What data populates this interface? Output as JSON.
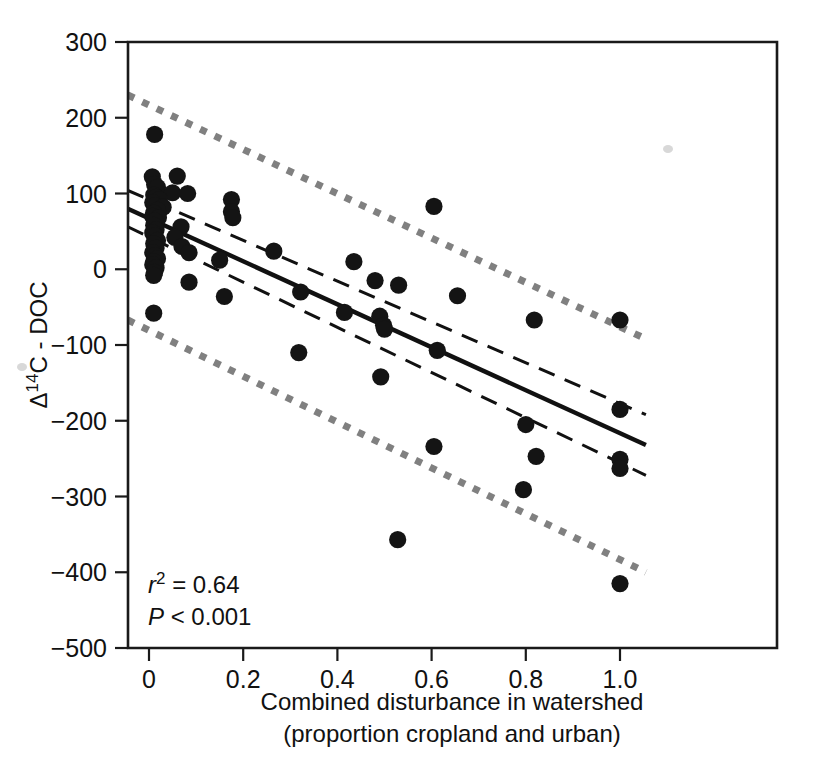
{
  "chart_data": {
    "type": "scatter",
    "title": "",
    "xlabel": "Combined disturbance in watershed",
    "xlabel_line2": "(proportion cropland and urban)",
    "ylabel": "Δ14C - DOC",
    "ylabel_delta": "Δ",
    "ylabel_sup": "14",
    "ylabel_rest": "C - DOC",
    "xlim": [
      -0.045,
      1.06
    ],
    "ylim": [
      -500,
      300
    ],
    "grid": false,
    "legend": false,
    "xticks": [
      0,
      0.2,
      0.4,
      0.6,
      0.8,
      1.0
    ],
    "xticklabels": [
      "0",
      "0.2",
      "0.4",
      "0.6",
      "0.8",
      "1.0"
    ],
    "yticks": [
      300,
      200,
      100,
      0,
      -100,
      -200,
      -300,
      -400,
      -500
    ],
    "yticklabels": [
      "300",
      "200",
      "100",
      "0",
      "−100",
      "−200",
      "−300",
      "−400",
      "−500"
    ],
    "annotations": {
      "r_squared_label": "r",
      "r_squared_sup": "2",
      "r_squared_value": " = 0.64",
      "p_label": "P",
      "p_value": " < 0.001"
    },
    "series": [
      {
        "name": "observations",
        "type": "scatter",
        "marker": "filled-circle",
        "color": "#141414",
        "points": [
          [
            0.012,
            178
          ],
          [
            0.007,
            122
          ],
          [
            0.06,
            123
          ],
          [
            0.012,
            112
          ],
          [
            0.018,
            108
          ],
          [
            0.05,
            101
          ],
          [
            0.082,
            100
          ],
          [
            0.01,
            98
          ],
          [
            0.015,
            95
          ],
          [
            0.022,
            92
          ],
          [
            0.008,
            88
          ],
          [
            0.175,
            92
          ],
          [
            0.012,
            84
          ],
          [
            0.03,
            82
          ],
          [
            0.018,
            78
          ],
          [
            0.01,
            74
          ],
          [
            0.175,
            76
          ],
          [
            0.008,
            70
          ],
          [
            0.02,
            68
          ],
          [
            0.012,
            64
          ],
          [
            0.178,
            68
          ],
          [
            0.01,
            58
          ],
          [
            0.068,
            56
          ],
          [
            0.015,
            52
          ],
          [
            0.008,
            48
          ],
          [
            0.012,
            44
          ],
          [
            0.055,
            42
          ],
          [
            0.018,
            38
          ],
          [
            0.01,
            34
          ],
          [
            0.07,
            30
          ],
          [
            0.015,
            28
          ],
          [
            0.008,
            22
          ],
          [
            0.085,
            22
          ],
          [
            0.012,
            18
          ],
          [
            0.018,
            14
          ],
          [
            0.01,
            10
          ],
          [
            0.15,
            12
          ],
          [
            0.008,
            6
          ],
          [
            0.265,
            24
          ],
          [
            0.015,
            2
          ],
          [
            0.012,
            -4
          ],
          [
            0.01,
            -8
          ],
          [
            0.085,
            -17
          ],
          [
            0.16,
            -36
          ],
          [
            0.435,
            10
          ],
          [
            0.605,
            83
          ],
          [
            0.322,
            -30
          ],
          [
            0.415,
            -57
          ],
          [
            0.48,
            -15
          ],
          [
            0.53,
            -21
          ],
          [
            0.49,
            -62
          ],
          [
            0.498,
            -74
          ],
          [
            0.5,
            -79
          ],
          [
            0.655,
            -35
          ],
          [
            0.612,
            -107
          ],
          [
            0.318,
            -110
          ],
          [
            0.492,
            -142
          ],
          [
            0.01,
            -58
          ],
          [
            0.605,
            -234
          ],
          [
            0.8,
            -205
          ],
          [
            0.818,
            -67
          ],
          [
            0.822,
            -247
          ],
          [
            0.795,
            -291
          ],
          [
            0.528,
            -357
          ],
          [
            1.0,
            -67
          ],
          [
            1.0,
            -185
          ],
          [
            1.0,
            -251
          ],
          [
            1.0,
            -263
          ],
          [
            1.0,
            -415
          ]
        ]
      },
      {
        "name": "regression-line",
        "type": "line",
        "style": "solid",
        "color": "#111111",
        "x": [
          -0.045,
          1.055
        ],
        "y": [
          80,
          -232
        ]
      },
      {
        "name": "confidence-band-upper",
        "type": "line",
        "style": "dashed",
        "color": "#111111",
        "x": [
          -0.045,
          1.055
        ],
        "y": [
          104,
          -192
        ]
      },
      {
        "name": "confidence-band-lower",
        "type": "line",
        "style": "dashed",
        "color": "#111111",
        "x": [
          -0.045,
          1.055
        ],
        "y": [
          56,
          -272
        ]
      },
      {
        "name": "prediction-band-upper",
        "type": "line",
        "style": "dotted",
        "color": "#808080",
        "x": [
          -0.045,
          1.055
        ],
        "y": [
          230,
          -92
        ]
      },
      {
        "name": "prediction-band-lower",
        "type": "line",
        "style": "dotted",
        "color": "#808080",
        "x": [
          -0.045,
          1.055
        ],
        "y": [
          -67,
          -400
        ]
      }
    ]
  }
}
